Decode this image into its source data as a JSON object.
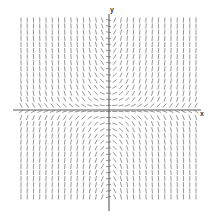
{
  "chart_data": {
    "type": "scatter",
    "subtype": "slope-field",
    "title": "",
    "xlabel": "x",
    "ylabel": "y",
    "xlim": [
      -7,
      7
    ],
    "ylim": [
      -7,
      7
    ],
    "grid": false,
    "legend": null,
    "equation": "dy/dx = x*y",
    "axes": {
      "x_axis_pixel_y": 110,
      "y_axis_pixel_x": 109,
      "x_axis_span_px": [
        13,
        201
      ],
      "y_axis_span_px": [
        14,
        211
      ],
      "axis_color": "#5a5a5a",
      "axis_width_px": 1.1
    },
    "field": {
      "tick_color": "#8c8c8c",
      "tick_width_px": 0.9,
      "tick_length_px": 5.2,
      "cols": 29,
      "rows": 30,
      "x_start_px": 21,
      "y_start_px": 20,
      "x_step_px": 6.25,
      "y_step_px": 6.1,
      "slope_scale": 0.11,
      "slope_sign": "x*y"
    },
    "quadrant_notes": [
      {
        "quadrant": "I",
        "slope_sign": "positive",
        "glyph": "/"
      },
      {
        "quadrant": "II",
        "slope_sign": "negative",
        "glyph": "\\"
      },
      {
        "quadrant": "III",
        "slope_sign": "positive",
        "glyph": "/"
      },
      {
        "quadrant": "IV",
        "slope_sign": "negative",
        "glyph": "\\"
      }
    ],
    "x_tick_labels": [],
    "y_tick_labels": []
  },
  "labels": {
    "x": "x",
    "y": "y"
  }
}
